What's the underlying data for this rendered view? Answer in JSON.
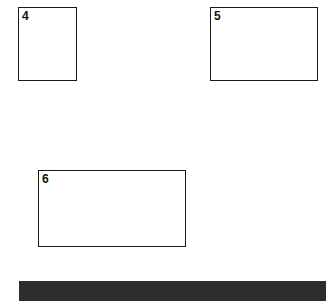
{
  "page": {
    "background_color": "#ffffff",
    "width": 326,
    "height": 301
  },
  "figures": [
    {
      "label": "4",
      "orientation": "portrait",
      "border_color": "#1a1a1a",
      "fill_color": "#ffffff"
    },
    {
      "label": "5",
      "orientation": "landscape",
      "border_color": "#1a1a1a",
      "fill_color": "#ffffff"
    },
    {
      "label": "6",
      "orientation": "landscape",
      "border_color": "#1a1a1a",
      "fill_color": "#ffffff"
    }
  ],
  "bottom_bar": {
    "color": "#2d2d2d"
  }
}
